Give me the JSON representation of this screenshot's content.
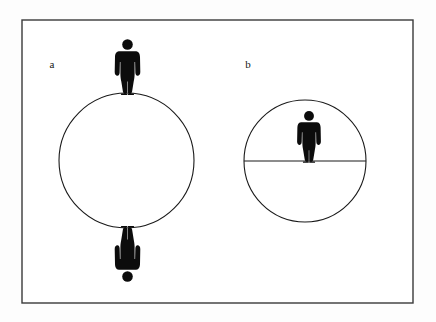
{
  "figure": {
    "title": "",
    "background_color": "#fdfdfd",
    "ink_color": "#111111",
    "frame": {
      "name": "figure-border",
      "x": 22,
      "y": 20,
      "width": 391,
      "height": 283,
      "stroke": "#3a3a3a",
      "stroke_width": 1.4,
      "fill": "#ffffff"
    },
    "panels": [
      {
        "id": "a",
        "label": "a",
        "label_x": 52,
        "label_y": 68,
        "circle": {
          "cx": 126.5,
          "cy": 160.5,
          "r": 67.5,
          "stroke": "#1a1a1a",
          "stroke_width": 1.1,
          "fill": "#ffffff"
        },
        "diameter_line": null,
        "figures": [
          {
            "role": "upright-person-on-top",
            "orientation": "upright",
            "x": 127.5,
            "baseline_y": 93,
            "height": 56,
            "fill": "#0c0c0c"
          },
          {
            "role": "inverted-person-below",
            "orientation": "inverted",
            "x": 127.5,
            "baseline_y": 228,
            "height": 56,
            "fill": "#0c0c0c"
          }
        ]
      },
      {
        "id": "b",
        "label": "b",
        "label_x": 248,
        "label_y": 68,
        "circle": {
          "cx": 305,
          "cy": 161,
          "r": 61,
          "stroke": "#1a1a1a",
          "stroke_width": 1.1,
          "fill": "#ffffff"
        },
        "diameter_line": {
          "name": "horizontal-diameter-line",
          "x1": 244,
          "y1": 161,
          "x2": 366,
          "y2": 161,
          "stroke": "#1a1a1a",
          "stroke_width": 1.1
        },
        "figures": [
          {
            "role": "upright-person-on-diameter",
            "orientation": "upright",
            "x": 309,
            "baseline_y": 161,
            "height": 52,
            "fill": "#0c0c0c"
          }
        ]
      }
    ]
  }
}
